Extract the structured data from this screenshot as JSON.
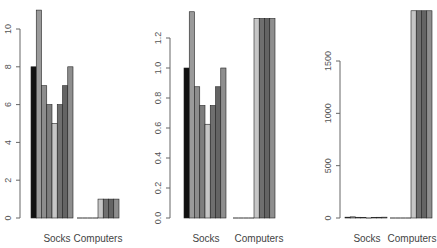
{
  "palette": [
    "#111111",
    "#9a9a9a",
    "#8d8d8d",
    "#7e7e7e",
    "#c6c6c6",
    "#6f6f6f",
    "#646464",
    "#8e8e8e"
  ],
  "chart_data": [
    {
      "type": "bar",
      "title": "",
      "xlabel": "",
      "ylabel": "",
      "categories": [
        "Socks",
        "Computers"
      ],
      "bars_per_group": 8,
      "grid": false,
      "legend": "none",
      "ylim": [
        0,
        11
      ],
      "yticks": [
        0,
        2,
        4,
        6,
        8,
        10
      ],
      "ytick_labels": [
        "0",
        "2",
        "4",
        "6",
        "8",
        "10"
      ],
      "groups": [
        {
          "name": "Socks",
          "values": [
            8,
            11,
            7,
            6,
            5,
            6,
            7,
            8
          ]
        },
        {
          "name": "Computers",
          "values": [
            0,
            0,
            0,
            0,
            1,
            1,
            1,
            1
          ]
        }
      ]
    },
    {
      "type": "bar",
      "title": "",
      "xlabel": "",
      "ylabel": "",
      "categories": [
        "Socks",
        "Computers"
      ],
      "bars_per_group": 8,
      "grid": false,
      "legend": "none",
      "ylim": [
        0,
        1.375
      ],
      "yticks": [
        0.0,
        0.2,
        0.4,
        0.6,
        0.8,
        1.0,
        1.2
      ],
      "ytick_labels": [
        "0.0",
        "0.2",
        "0.4",
        "0.6",
        "0.8",
        "1.0",
        "1.2"
      ],
      "groups": [
        {
          "name": "Socks",
          "values": [
            1.0,
            1.375,
            0.875,
            0.75,
            0.625,
            0.75,
            0.875,
            1.0
          ]
        },
        {
          "name": "Computers",
          "values": [
            0,
            0,
            0,
            0,
            1.33,
            1.33,
            1.33,
            1.33
          ]
        }
      ]
    },
    {
      "type": "bar",
      "title": "",
      "xlabel": "",
      "ylabel": "",
      "categories": [
        "Socks",
        "Computers"
      ],
      "bars_per_group": 8,
      "grid": false,
      "legend": "none",
      "ylim": [
        0,
        1980
      ],
      "yticks": [
        0,
        500,
        1000,
        1500
      ],
      "ytick_labels": [
        "0",
        "500",
        "1000",
        "1500"
      ],
      "groups": [
        {
          "name": "Socks",
          "values": [
            8,
            11,
            7,
            6,
            5,
            6,
            7,
            8
          ]
        },
        {
          "name": "Computers",
          "values": [
            0,
            0,
            0,
            0,
            1980,
            1980,
            1980,
            1980
          ]
        }
      ]
    }
  ],
  "layout": [
    {
      "axis_x": 20,
      "plot_top": 29,
      "base_y": 218,
      "top_tick_y": 29,
      "group_x": [
        31,
        77
      ],
      "bar_w": 5.25,
      "label_x": [
        57,
        98
      ]
    },
    {
      "axis_x": 170,
      "plot_top": 10,
      "base_y": 218,
      "top_tick_y": 38,
      "group_x": [
        184,
        233
      ],
      "bar_w": 5.25,
      "label_x": [
        206,
        259
      ]
    },
    {
      "axis_x": 340,
      "plot_top": 11,
      "base_y": 218,
      "top_tick_y": 61,
      "group_x": [
        345,
        390
      ],
      "bar_w": 5.25,
      "label_x": [
        367,
        412
      ]
    }
  ]
}
